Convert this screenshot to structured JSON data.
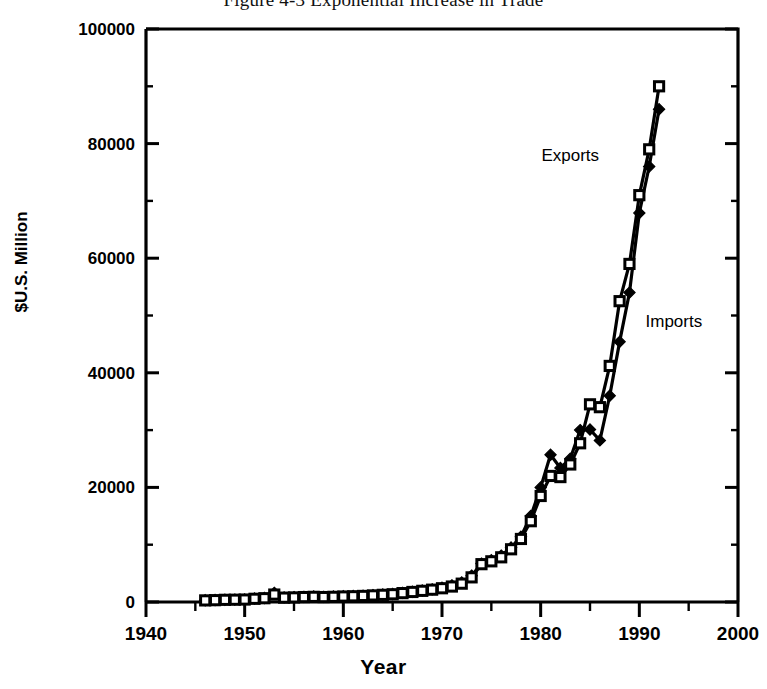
{
  "figure": {
    "title": "Figure 4-3  Exponential Increase in Trade"
  },
  "chart_data": {
    "type": "line",
    "title": "Figure 4-3  Exponential Increase in Trade",
    "subtitle": "",
    "xlabel": "Year",
    "ylabel": "$U.S.  Million",
    "xlim": [
      1940,
      2000
    ],
    "ylim": [
      0,
      100000
    ],
    "x_ticks": [
      1940,
      1950,
      1960,
      1970,
      1980,
      1990,
      2000
    ],
    "x_tick_labels": [
      "1940",
      "1950",
      "1960",
      "1970",
      "1980",
      "1990",
      "2000"
    ],
    "x_minor_ticks": [
      1945,
      1955,
      1965,
      1975,
      1985,
      1995
    ],
    "y_ticks": [
      0,
      20000,
      40000,
      60000,
      80000,
      100000
    ],
    "y_tick_labels": [
      "0",
      "20000",
      "40000",
      "60000",
      "80000",
      "100000"
    ],
    "y_minor_ticks": [
      10000,
      30000,
      50000,
      70000,
      90000
    ],
    "grid": false,
    "legend": "inline-annotations",
    "annotations": [
      {
        "text": "Exports",
        "x": 1983.0,
        "y": 77000
      },
      {
        "text": "Imports",
        "x": 1993.5,
        "y": 48000
      }
    ],
    "x": [
      1946,
      1947,
      1948,
      1949,
      1950,
      1951,
      1952,
      1953,
      1954,
      1955,
      1956,
      1957,
      1958,
      1959,
      1960,
      1961,
      1962,
      1963,
      1964,
      1965,
      1966,
      1967,
      1968,
      1969,
      1970,
      1971,
      1972,
      1973,
      1974,
      1975,
      1976,
      1977,
      1978,
      1979,
      1980,
      1981,
      1982,
      1983,
      1984,
      1985,
      1986,
      1987,
      1988,
      1989,
      1990,
      1991,
      1992
    ],
    "series": [
      {
        "name": "Exports",
        "marker": "filled-diamond",
        "values": [
          300,
          350,
          400,
          420,
          450,
          600,
          700,
          1600,
          800,
          850,
          900,
          950,
          900,
          950,
          1000,
          1050,
          1100,
          1200,
          1300,
          1400,
          1600,
          1800,
          2000,
          2200,
          2500,
          2900,
          3400,
          4600,
          6700,
          7300,
          8100,
          9500,
          11400,
          15000,
          20000,
          25700,
          23400,
          25000,
          30000,
          30100,
          28200,
          36000,
          45400,
          54000,
          67900,
          76000,
          86000
        ]
      },
      {
        "name": "Imports",
        "marker": "open-square",
        "values": [
          280,
          320,
          380,
          400,
          430,
          560,
          660,
          1300,
          760,
          800,
          860,
          900,
          860,
          900,
          960,
          1000,
          1060,
          1150,
          1250,
          1350,
          1550,
          1750,
          1950,
          2150,
          2400,
          2700,
          3200,
          4300,
          6600,
          7100,
          7800,
          9200,
          11000,
          14100,
          18500,
          22000,
          21800,
          24000,
          27700,
          34500,
          34000,
          41200,
          52500,
          59000,
          71000,
          79000,
          90000
        ]
      }
    ]
  }
}
